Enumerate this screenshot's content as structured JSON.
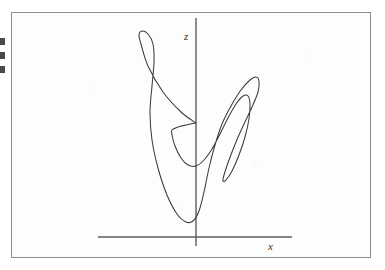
{
  "figure": {
    "caption_visible": false,
    "frame": {
      "border_color": "#8e8e8e",
      "background_color": "#fdfdfc"
    },
    "ink_color": "#3b3b3b",
    "axis_color": "#5c5c5c"
  },
  "axes": {
    "vertical": {
      "label": "z",
      "name": "z-axis"
    },
    "horizontal": {
      "label": "x",
      "name": "x-axis"
    }
  },
  "chart_data": {
    "type": "line",
    "title": "",
    "subtitle": "",
    "xlabel": "x",
    "ylabel": "z",
    "grid": false,
    "legend": null,
    "annotations": [],
    "axis_style": "crossed-origin-arrowless",
    "origin_px": {
      "x": 196,
      "y": 237
    },
    "x_axis_extent_px": [
      98,
      292
    ],
    "y_axis_extent_px": [
      18,
      246
    ],
    "xlim": null,
    "ylim": null,
    "tick_labels": {
      "x": [],
      "y": []
    },
    "series": [
      {
        "name": "trajectory",
        "closed": false,
        "points_px": [
          [
            196,
            123
          ],
          [
            181,
            112
          ],
          [
            163,
            92
          ],
          [
            148,
            66
          ],
          [
            141,
            44
          ],
          [
            139,
            35
          ],
          [
            142,
            31
          ],
          [
            148,
            34
          ],
          [
            153,
            44
          ],
          [
            154,
            62
          ],
          [
            152,
            86
          ],
          [
            150,
            112
          ],
          [
            152,
            140
          ],
          [
            158,
            168
          ],
          [
            167,
            195
          ],
          [
            177,
            214
          ],
          [
            186,
            222
          ],
          [
            193,
            221
          ],
          [
            199,
            211
          ],
          [
            204,
            192
          ],
          [
            209,
            168
          ],
          [
            215,
            145
          ],
          [
            222,
            124
          ],
          [
            231,
            106
          ],
          [
            241,
            90
          ],
          [
            250,
            80
          ],
          [
            256,
            77
          ],
          [
            259,
            81
          ],
          [
            258,
            92
          ],
          [
            252,
            107
          ],
          [
            244,
            124
          ],
          [
            236,
            142
          ],
          [
            229,
            160
          ],
          [
            224,
            175
          ],
          [
            223,
            181
          ],
          [
            226,
            180
          ],
          [
            232,
            171
          ],
          [
            239,
            155
          ],
          [
            245,
            137
          ],
          [
            249,
            119
          ],
          [
            250,
            104
          ],
          [
            248,
            96
          ],
          [
            243,
            96
          ],
          [
            236,
            104
          ],
          [
            228,
            118
          ],
          [
            220,
            134
          ],
          [
            212,
            149
          ],
          [
            204,
            160
          ],
          [
            196,
            166
          ],
          [
            188,
            165
          ],
          [
            181,
            158
          ],
          [
            175,
            146
          ],
          [
            172,
            135
          ],
          [
            172,
            130
          ],
          [
            178,
            127
          ],
          [
            186,
            125
          ],
          [
            196,
            123
          ]
        ]
      }
    ]
  },
  "artifacts": {
    "edge_marks_count": 3,
    "edge_marks_color": "#4a4a4a"
  }
}
